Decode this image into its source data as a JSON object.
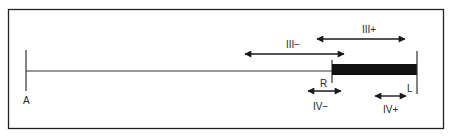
{
  "diagram": {
    "type": "segment-range-diagram",
    "frame": {
      "color": "#222222"
    },
    "baseline": {
      "start_label": "A",
      "end_label": "L"
    },
    "bar": {
      "start_label": "R",
      "end_label": "L",
      "color": "#111111"
    },
    "ranges": [
      {
        "id": "III-plus",
        "label": "III+"
      },
      {
        "id": "III-minus",
        "label": "III−"
      },
      {
        "id": "IV-minus",
        "label": "IV−"
      },
      {
        "id": "IV-plus",
        "label": "IV+"
      }
    ],
    "points": {
      "A": "A",
      "R": "R",
      "L": "L"
    }
  }
}
